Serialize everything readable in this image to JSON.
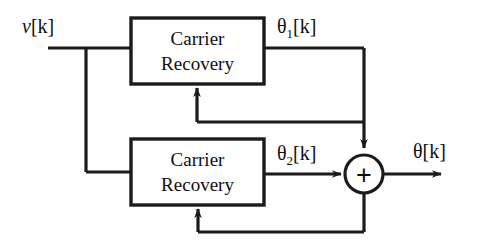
{
  "diagram": {
    "stroke_color": "#1b1b1b",
    "background_color": "#ffffff",
    "blocks": [
      {
        "id": "carrier-recovery-1",
        "line1": "Carrier",
        "line2": "Recovery",
        "x": 131,
        "y": 18,
        "width": 133,
        "height": 66
      },
      {
        "id": "carrier-recovery-2",
        "line1": "Carrier",
        "line2": "Recovery",
        "x": 131,
        "y": 139,
        "width": 133,
        "height": 66
      }
    ],
    "summing_junction": {
      "id": "summing-junction",
      "cx": 364,
      "cy": 174,
      "r": 19,
      "operator": "+"
    },
    "signals": {
      "input": {
        "var": "v",
        "index": "[k]",
        "sub": ""
      },
      "branch_top": {
        "var": "θ",
        "index": "[k]",
        "sub": "1"
      },
      "branch_bottom": {
        "var": "θ",
        "index": "[k]",
        "sub": "2"
      },
      "output": {
        "var": "θ",
        "index": "[k]",
        "sub": ""
      }
    },
    "connections": [
      "input v[k] splits to both Carrier Recovery blocks",
      "Carrier Recovery 1 output theta1[k] to summing junction top input",
      "theta1[k] feeds back into Carrier Recovery 1 bottom input",
      "Carrier Recovery 2 output theta2[k] to summing junction left input",
      "summing junction output theta[k] feeds back into Carrier Recovery 2 bottom input"
    ]
  }
}
